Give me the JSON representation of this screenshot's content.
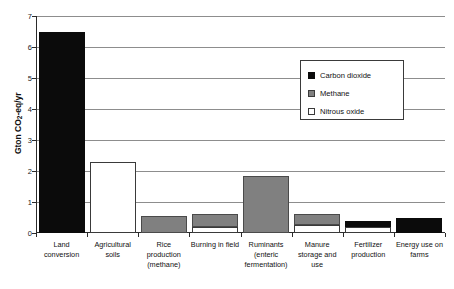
{
  "chart_data": {
    "type": "bar",
    "title": "",
    "xlabel": "",
    "ylabel": "Gton CO2-eq/yr",
    "ylabel_parts": {
      "pre": "Gton CO",
      "sub": "2",
      "post": "-eq/yr"
    },
    "ylim": [
      0,
      7
    ],
    "ytick_labels": [
      "0",
      "1",
      "2",
      "3",
      "4",
      "5",
      "6",
      "7"
    ],
    "ytick_values": [
      0,
      1,
      2,
      3,
      4,
      5,
      6,
      7
    ],
    "grid": true,
    "grid_axis": "y",
    "stacked": true,
    "legend_position": "upper right",
    "categories": [
      "Land conversion",
      "Agricultural soils",
      "Rice production (methane)",
      "Burning in field",
      "Ruminants (enteric fermentation)",
      "Manure storage and use",
      "Fertilizer production",
      "Energy use on farms"
    ],
    "series": [
      {
        "name": "Carbon dioxide",
        "color": "#0b0b0b",
        "values": [
          6.5,
          0,
          0,
          0,
          0,
          0,
          0.2,
          0.5
        ]
      },
      {
        "name": "Methane",
        "color": "#808080",
        "values": [
          0,
          0,
          0.55,
          0.4,
          1.85,
          0.35,
          0,
          0
        ]
      },
      {
        "name": "Nitrous oxide",
        "color": "#ffffff",
        "values": [
          0,
          2.3,
          0,
          0.2,
          0,
          0.25,
          0.2,
          0
        ]
      }
    ],
    "totals": [
      6.5,
      2.3,
      0.55,
      0.6,
      1.85,
      0.6,
      0.4,
      0.5
    ]
  },
  "legend": {
    "items": [
      {
        "label": "Carbon dioxide",
        "swatch": "co2"
      },
      {
        "label": "Methane",
        "swatch": "ch4"
      },
      {
        "label": "Nitrous oxide",
        "swatch": "n2o"
      }
    ]
  }
}
